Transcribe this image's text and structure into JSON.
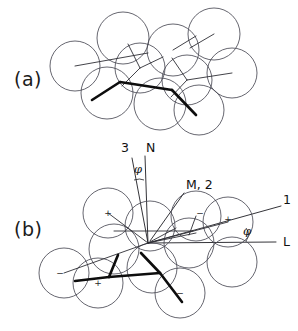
{
  "figure": {
    "background_color": "#ffffff",
    "ink_color": "#1d1d22",
    "circle_stroke_color": "#4a4a55",
    "bold_bond_color": "#0d0d0d",
    "width": 298,
    "height": 331
  },
  "panels": [
    {
      "id": "a",
      "label": "(a)",
      "label_x": 14,
      "label_y": 86,
      "description": "Upper packing view without angle annotations",
      "atoms": [
        {
          "cx": 75,
          "cy": 66,
          "r": 25
        },
        {
          "cx": 123,
          "cy": 38,
          "r": 26
        },
        {
          "cx": 140,
          "cy": 68,
          "r": 25
        },
        {
          "cx": 107,
          "cy": 93,
          "r": 26
        },
        {
          "cx": 173,
          "cy": 50,
          "r": 26
        },
        {
          "cx": 187,
          "cy": 80,
          "r": 25
        },
        {
          "cx": 214,
          "cy": 34,
          "r": 26
        },
        {
          "cx": 232,
          "cy": 73,
          "r": 25
        },
        {
          "cx": 160,
          "cy": 104,
          "r": 26
        },
        {
          "cx": 199,
          "cy": 110,
          "r": 25
        }
      ],
      "thin_bonds": [
        {
          "x1": 75,
          "y1": 66,
          "x2": 148,
          "y2": 53
        },
        {
          "x1": 140,
          "y1": 68,
          "x2": 128,
          "y2": 44
        },
        {
          "x1": 140,
          "y1": 68,
          "x2": 122,
          "y2": 86
        },
        {
          "x1": 140,
          "y1": 68,
          "x2": 163,
          "y2": 57
        },
        {
          "x1": 173,
          "y1": 50,
          "x2": 196,
          "y2": 36
        },
        {
          "x1": 187,
          "y1": 80,
          "x2": 232,
          "y2": 73
        },
        {
          "x1": 187,
          "y1": 80,
          "x2": 172,
          "y2": 58
        },
        {
          "x1": 187,
          "y1": 80,
          "x2": 171,
          "y2": 97
        },
        {
          "x1": 214,
          "y1": 34,
          "x2": 190,
          "y2": 48
        }
      ],
      "bold_bonds": [
        {
          "x1": 92,
          "y1": 100,
          "x2": 120,
          "y2": 82
        },
        {
          "x1": 120,
          "y1": 82,
          "x2": 172,
          "y2": 90
        },
        {
          "x1": 172,
          "y1": 90,
          "x2": 196,
          "y2": 115
        }
      ]
    },
    {
      "id": "b",
      "label": "(b)",
      "label_x": 14,
      "label_y": 236,
      "description": "Lower packing view with crystallographic axis annotations",
      "origin": {
        "x": 148,
        "y": 243
      },
      "atoms": [
        {
          "cx": 64,
          "cy": 273,
          "r": 25,
          "charge": "−",
          "charge_dx": -4,
          "charge_dy": 3
        },
        {
          "cx": 108,
          "cy": 213,
          "r": 25,
          "charge": "+",
          "charge_dx": 0,
          "charge_dy": 3
        },
        {
          "cx": 98,
          "cy": 283,
          "r": 25,
          "charge": "+",
          "charge_dx": 0,
          "charge_dy": 3
        },
        {
          "cx": 114,
          "cy": 249,
          "r": 25
        },
        {
          "cx": 150,
          "cy": 226,
          "r": 25
        },
        {
          "cx": 152,
          "cy": 268,
          "r": 25
        },
        {
          "cx": 180,
          "cy": 293,
          "r": 25,
          "charge": "−",
          "charge_dx": 0,
          "charge_dy": 3
        },
        {
          "cx": 189,
          "cy": 243,
          "r": 25
        },
        {
          "cx": 196,
          "cy": 216,
          "r": 25,
          "charge": "−",
          "charge_dx": 4,
          "charge_dy": 0
        },
        {
          "cx": 228,
          "cy": 222,
          "r": 25,
          "charge": "+",
          "charge_dx": 0,
          "charge_dy": 0
        },
        {
          "cx": 232,
          "cy": 262,
          "r": 25
        }
      ],
      "thin_bonds": [
        {
          "x1": 108,
          "y1": 213,
          "x2": 148,
          "y2": 243
        },
        {
          "x1": 64,
          "y1": 273,
          "x2": 148,
          "y2": 243
        },
        {
          "x1": 148,
          "y1": 243,
          "x2": 228,
          "y2": 222
        },
        {
          "x1": 148,
          "y1": 243,
          "x2": 196,
          "y2": 233
        },
        {
          "x1": 148,
          "y1": 243,
          "x2": 176,
          "y2": 228
        },
        {
          "x1": 114,
          "y1": 231,
          "x2": 193,
          "y2": 231
        },
        {
          "x1": 196,
          "y1": 216,
          "x2": 189,
          "y2": 235
        }
      ],
      "bold_bonds": [
        {
          "x1": 75,
          "y1": 281,
          "x2": 109,
          "y2": 277
        },
        {
          "x1": 109,
          "y1": 277,
          "x2": 118,
          "y2": 255
        },
        {
          "x1": 109,
          "y1": 277,
          "x2": 160,
          "y2": 273
        },
        {
          "x1": 160,
          "y1": 273,
          "x2": 141,
          "y2": 253
        },
        {
          "x1": 160,
          "y1": 273,
          "x2": 182,
          "y2": 302
        }
      ],
      "annotations": [
        {
          "name": "axis-3",
          "label": "3",
          "label_x": 121,
          "label_y": 152,
          "line": {
            "x1": 132,
            "y1": 158,
            "x2": 148,
            "y2": 243
          }
        },
        {
          "name": "axis-N",
          "label": "N",
          "label_x": 146,
          "label_y": 152,
          "line": {
            "x1": 145,
            "y1": 156,
            "x2": 148,
            "y2": 243
          }
        },
        {
          "name": "angle-phi-upper",
          "label": "φ",
          "label_x": 134,
          "label_y": 173,
          "arc": "M 134 180 Q 140 178 144 180"
        },
        {
          "name": "axis-M2",
          "label": "M, 2",
          "label_x": 186,
          "label_y": 189,
          "line": {
            "x1": 184,
            "y1": 193,
            "x2": 150,
            "y2": 241
          }
        },
        {
          "name": "axis-1",
          "label": "1",
          "label_x": 283,
          "label_y": 204,
          "line": {
            "x1": 148,
            "y1": 243,
            "x2": 281,
            "y2": 206
          }
        },
        {
          "name": "axis-L",
          "label": "L",
          "label_x": 283,
          "label_y": 246,
          "line": {
            "x1": 148,
            "y1": 243,
            "x2": 276,
            "y2": 242
          }
        },
        {
          "name": "angle-phi-lower",
          "label": "φ",
          "label_x": 243,
          "label_y": 235,
          "arc": "M 246 228 Q 251 234 246 241"
        }
      ]
    }
  ]
}
